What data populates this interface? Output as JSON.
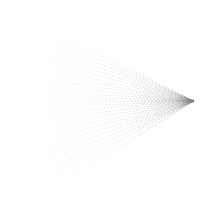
{
  "figure": {
    "type": "vector-line-figure",
    "width": 220,
    "height": 199,
    "background_color": "#ffffff"
  },
  "chart_data": {
    "type": "line",
    "title": "",
    "subtitle": "",
    "xlabel": "",
    "ylabel": "",
    "grid": false,
    "legend": null,
    "xlim": [
      0,
      220
    ],
    "ylim": [
      0,
      199
    ],
    "apex": {
      "x": 194,
      "y": 101
    },
    "ray_count": 26,
    "stroke_color": "#7d7d83",
    "dash_pattern": [
      1.6,
      1.9
    ],
    "stroke_width": 0.85,
    "wedge": {
      "points": "194,101 166,86 172,101 166,117",
      "fill_color": "#8c8c92",
      "opacity": 0.88
    },
    "series": [
      {
        "name": "ray-01",
        "x": [
          42.0,
          194.0
        ],
        "y": [
          27.0,
          101.0
        ],
        "opacity": 0.3
      },
      {
        "name": "ray-02",
        "x": [
          40.0,
          194.0
        ],
        "y": [
          33.5,
          101.0
        ],
        "opacity": 0.32
      },
      {
        "name": "ray-03",
        "x": [
          39.0,
          194.0
        ],
        "y": [
          40.0,
          101.0
        ],
        "opacity": 0.31
      },
      {
        "name": "ray-04",
        "x": [
          38.5,
          194.0
        ],
        "y": [
          46.5,
          101.0
        ],
        "opacity": 0.33
      },
      {
        "name": "ray-05",
        "x": [
          38.0,
          194.0
        ],
        "y": [
          53.0,
          101.0
        ],
        "opacity": 0.32
      },
      {
        "name": "ray-06",
        "x": [
          38.0,
          194.0
        ],
        "y": [
          59.5,
          101.0
        ],
        "opacity": 0.34
      },
      {
        "name": "ray-07",
        "x": [
          38.0,
          194.0
        ],
        "y": [
          66.0,
          101.0
        ],
        "opacity": 0.33
      },
      {
        "name": "ray-08",
        "x": [
          38.5,
          194.0
        ],
        "y": [
          72.5,
          101.0
        ],
        "opacity": 0.35
      },
      {
        "name": "ray-09",
        "x": [
          39.0,
          194.0
        ],
        "y": [
          79.0,
          101.0
        ],
        "opacity": 0.34
      },
      {
        "name": "ray-10",
        "x": [
          40.0,
          194.0
        ],
        "y": [
          85.0,
          101.0
        ],
        "opacity": 0.36
      },
      {
        "name": "ray-11",
        "x": [
          41.0,
          194.0
        ],
        "y": [
          90.5,
          101.0
        ],
        "opacity": 0.35
      },
      {
        "name": "ray-12",
        "x": [
          42.0,
          194.0
        ],
        "y": [
          95.5,
          101.0
        ],
        "opacity": 0.34
      },
      {
        "name": "ray-13",
        "x": [
          43.0,
          194.0
        ],
        "y": [
          99.5,
          101.0
        ],
        "opacity": 0.3
      },
      {
        "name": "ray-14",
        "x": [
          43.0,
          194.0
        ],
        "y": [
          103.0,
          101.0
        ],
        "opacity": 0.3
      },
      {
        "name": "ray-15",
        "x": [
          42.0,
          194.0
        ],
        "y": [
          107.5,
          101.0
        ],
        "opacity": 0.34
      },
      {
        "name": "ray-16",
        "x": [
          41.0,
          194.0
        ],
        "y": [
          113.0,
          101.0
        ],
        "opacity": 0.35
      },
      {
        "name": "ray-17",
        "x": [
          40.0,
          194.0
        ],
        "y": [
          119.5,
          101.0
        ],
        "opacity": 0.36
      },
      {
        "name": "ray-18",
        "x": [
          39.5,
          194.0
        ],
        "y": [
          126.5,
          101.0
        ],
        "opacity": 0.35
      },
      {
        "name": "ray-19",
        "x": [
          39.0,
          194.0
        ],
        "y": [
          133.5,
          101.0
        ],
        "opacity": 0.36
      },
      {
        "name": "ray-20",
        "x": [
          39.0,
          194.0
        ],
        "y": [
          141.0,
          101.0
        ],
        "opacity": 0.35
      },
      {
        "name": "ray-21",
        "x": [
          39.5,
          194.0
        ],
        "y": [
          148.5,
          101.0
        ],
        "opacity": 0.36
      },
      {
        "name": "ray-22",
        "x": [
          40.5,
          194.0
        ],
        "y": [
          156.0,
          101.0
        ],
        "opacity": 0.35
      },
      {
        "name": "ray-23",
        "x": [
          41.5,
          194.0
        ],
        "y": [
          163.5,
          101.0
        ],
        "opacity": 0.34
      },
      {
        "name": "ray-24",
        "x": [
          42.5,
          194.0
        ],
        "y": [
          171.5,
          101.0
        ],
        "opacity": 0.34
      },
      {
        "name": "ray-25",
        "x": [
          43.5,
          194.0
        ],
        "y": [
          180.0,
          101.0
        ],
        "opacity": 0.33
      },
      {
        "name": "ray-26",
        "x": [
          45.0,
          194.0
        ],
        "y": [
          193.0,
          101.0
        ],
        "opacity": 0.32
      }
    ]
  }
}
